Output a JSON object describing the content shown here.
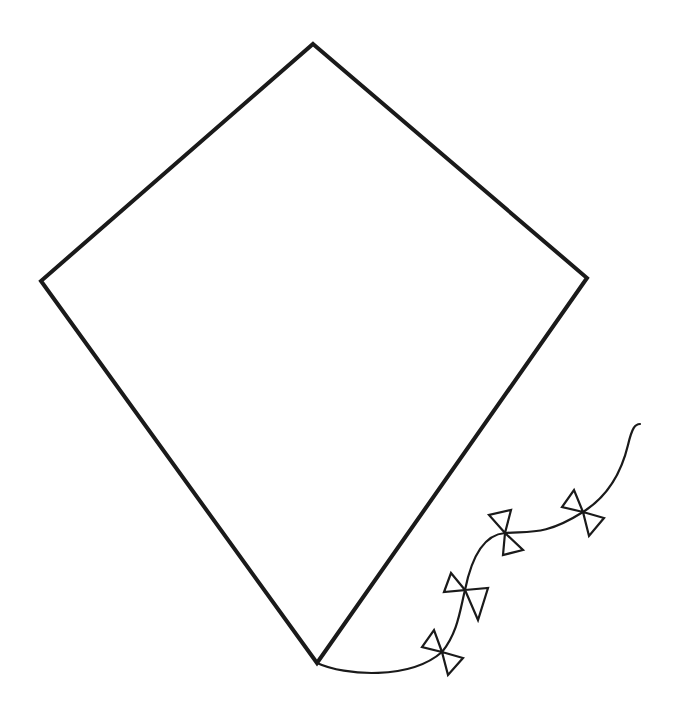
{
  "title": "Kite outline drawing",
  "colors": {
    "background": "#ffffff",
    "stroke": "#1a1a1a"
  },
  "kite": {
    "vertices": {
      "top": [
        313,
        44
      ],
      "right": [
        587,
        278
      ],
      "bottom": [
        317,
        663
      ],
      "left": [
        41,
        281
      ]
    },
    "stroke_width": 4
  },
  "tail": {
    "path": "M317,663 C345,676 410,680 442,652 C458,632 460,610 465,590 C470,565 480,535 505,533 C530,531 545,536 583,512 C610,495 622,470 628,445 C632,428 635,424 640,424",
    "stroke_width": 2.2
  },
  "bows": [
    {
      "name": "bow-1",
      "center": [
        442,
        652
      ],
      "left": [
        [
          434,
          630
        ],
        [
          422,
          647
        ]
      ],
      "right": [
        [
          463,
          658
        ],
        [
          448,
          675
        ]
      ]
    },
    {
      "name": "bow-2",
      "center": [
        465,
        590
      ],
      "left": [
        [
          451,
          573
        ],
        [
          444,
          592
        ]
      ],
      "right": [
        [
          488,
          588
        ],
        [
          478,
          620
        ]
      ]
    },
    {
      "name": "bow-3",
      "center": [
        505,
        533
      ],
      "left": [
        [
          489,
          515
        ],
        [
          511,
          510
        ]
      ],
      "right": [
        [
          523,
          550
        ],
        [
          503,
          555
        ]
      ]
    },
    {
      "name": "bow-4",
      "center": [
        583,
        512
      ],
      "left": [
        [
          574,
          490
        ],
        [
          562,
          507
        ]
      ],
      "right": [
        [
          604,
          518
        ],
        [
          589,
          536
        ]
      ]
    }
  ]
}
